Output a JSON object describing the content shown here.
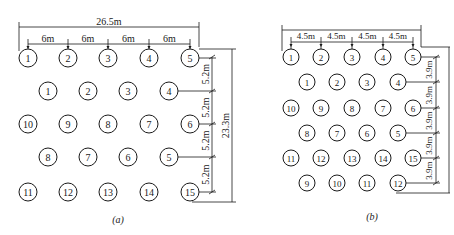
{
  "diagrams": [
    {
      "id": "a",
      "caption": "(a)",
      "caption_pos": [
        118,
        219
      ],
      "overall_width_label": "26.5m",
      "overall_width_line": {
        "y": 27,
        "x1": 19,
        "x2": 199
      },
      "spacing_line": {
        "y": 44,
        "x1": 28,
        "x2": 190
      },
      "spacing_ticks": [
        28,
        68,
        108,
        149,
        190
      ],
      "spacing_labels": [
        "6m",
        "6m",
        "6m",
        "6m"
      ],
      "radius": 9,
      "font_size": 10,
      "rows": [
        {
          "y": 58,
          "xs": [
            28,
            68,
            108,
            149,
            190
          ],
          "labels": [
            "1",
            "2",
            "3",
            "4",
            "5"
          ]
        },
        {
          "y": 91,
          "xs": [
            48,
            88,
            128,
            169
          ],
          "labels": [
            "1",
            "2",
            "3",
            "4"
          ]
        },
        {
          "y": 124,
          "xs": [
            28,
            68,
            108,
            149,
            190
          ],
          "labels": [
            "10",
            "9",
            "8",
            "7",
            "6"
          ]
        },
        {
          "y": 157,
          "xs": [
            48,
            88,
            128,
            169
          ],
          "labels": [
            "8",
            "7",
            "6",
            "5"
          ]
        },
        {
          "y": 192,
          "xs": [
            28,
            68,
            108,
            149,
            190
          ],
          "labels": [
            "11",
            "12",
            "13",
            "14",
            "15"
          ]
        }
      ],
      "row_dim_line_x": 212,
      "row_dim_ticks": [
        57,
        91,
        124,
        157,
        192
      ],
      "row_dim_labels": [
        "5.2m",
        "5.2m",
        "5.2m",
        "5.2m"
      ],
      "overall_height_label": "23.3m",
      "overall_height_line": {
        "x": 232,
        "y1": 49,
        "y2": 202
      }
    },
    {
      "id": "b",
      "caption": "(b)",
      "caption_pos": [
        372,
        216
      ],
      "overall_width_label": "",
      "overall_width_line": {
        "y": 30,
        "x1": 282,
        "x2": 421
      },
      "spacing_line": {
        "y": 42,
        "x1": 291,
        "x2": 413
      },
      "spacing_ticks": [
        291,
        321,
        352,
        383,
        413
      ],
      "spacing_labels": [
        "4.5m",
        "4.5m",
        "4.5m",
        "4.5m"
      ],
      "radius": 8,
      "font_size": 9,
      "rows": [
        {
          "y": 57,
          "xs": [
            291,
            321,
            352,
            383,
            413
          ],
          "labels": [
            "1",
            "2",
            "3",
            "4",
            "5"
          ]
        },
        {
          "y": 82,
          "xs": [
            307,
            337,
            367,
            398
          ],
          "labels": [
            "1",
            "2",
            "3",
            "4"
          ]
        },
        {
          "y": 108,
          "xs": [
            291,
            321,
            352,
            383,
            413
          ],
          "labels": [
            "10",
            "9",
            "8",
            "7",
            "6"
          ]
        },
        {
          "y": 133,
          "xs": [
            307,
            337,
            367,
            398
          ],
          "labels": [
            "8",
            "7",
            "6",
            "5"
          ]
        },
        {
          "y": 158,
          "xs": [
            291,
            321,
            352,
            383,
            413
          ],
          "labels": [
            "11",
            "12",
            "13",
            "14",
            "15"
          ]
        },
        {
          "y": 183,
          "xs": [
            307,
            337,
            367,
            398
          ],
          "labels": [
            "9",
            "10",
            "11",
            "12"
          ]
        }
      ],
      "row_dim_line_x": 436,
      "row_dim_ticks": [
        57,
        82,
        108,
        133,
        158,
        183
      ],
      "row_dim_labels": [
        "3.9m",
        "3.9m",
        "3.9m",
        "3.9m",
        "3.9m"
      ],
      "overall_height_label": "",
      "overall_height_line": null
    }
  ],
  "colors": {
    "line": "#1a1a1a",
    "background": "#ffffff"
  }
}
